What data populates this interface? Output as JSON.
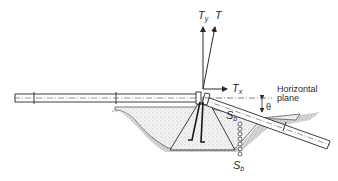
{
  "diagram": {
    "type": "thrust-block-free-body",
    "labels": {
      "T": "T",
      "Ty_main": "T",
      "Ty_sub": "y",
      "Tx_main": "T",
      "Tx_sub": "x",
      "theta": "θ",
      "horizontal_plane_line1": "Horizontal",
      "horizontal_plane_line2": "plane",
      "Sb_upper_main": "S",
      "Sb_upper_sub": "b",
      "Sb_lower_main": "S",
      "Sb_lower_sub": "b"
    },
    "colors": {
      "line": "#2a2a2a",
      "soil_fill": "#e6e6e6",
      "concrete_fill": "#f0f0f0",
      "background": "#ffffff"
    }
  }
}
